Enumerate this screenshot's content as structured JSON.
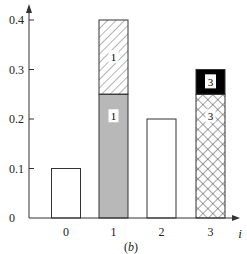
{
  "chart_data": {
    "type": "bar",
    "subtype": "stacked",
    "title": "",
    "caption": "(b)",
    "xlabel": "i",
    "ylabel": "",
    "categories": [
      "0",
      "1",
      "2",
      "3"
    ],
    "yticks": [
      "0",
      "0.1",
      "0.2",
      "0.3",
      "0.4"
    ],
    "ylim": [
      0,
      0.42
    ],
    "grid": false,
    "legend": "none",
    "bars": [
      {
        "category": "0",
        "segments": [
          {
            "value": 0.1,
            "fill": "white",
            "label": ""
          }
        ]
      },
      {
        "category": "1",
        "segments": [
          {
            "value": 0.25,
            "fill": "gray",
            "label": "1"
          },
          {
            "value": 0.15,
            "fill": "diagonal-hatch",
            "label": "1"
          }
        ]
      },
      {
        "category": "2",
        "segments": [
          {
            "value": 0.2,
            "fill": "white",
            "label": ""
          }
        ]
      },
      {
        "category": "3",
        "segments": [
          {
            "value": 0.25,
            "fill": "crosshatch",
            "label": "3"
          },
          {
            "value": 0.05,
            "fill": "black",
            "label": "3"
          }
        ]
      }
    ],
    "totals": [
      0.1,
      0.4,
      0.2,
      0.3
    ]
  },
  "colors": {
    "axis": "#333333",
    "gray_fill": "#b8b8b8",
    "black_fill": "#000000",
    "bar_edge": "#333333"
  }
}
